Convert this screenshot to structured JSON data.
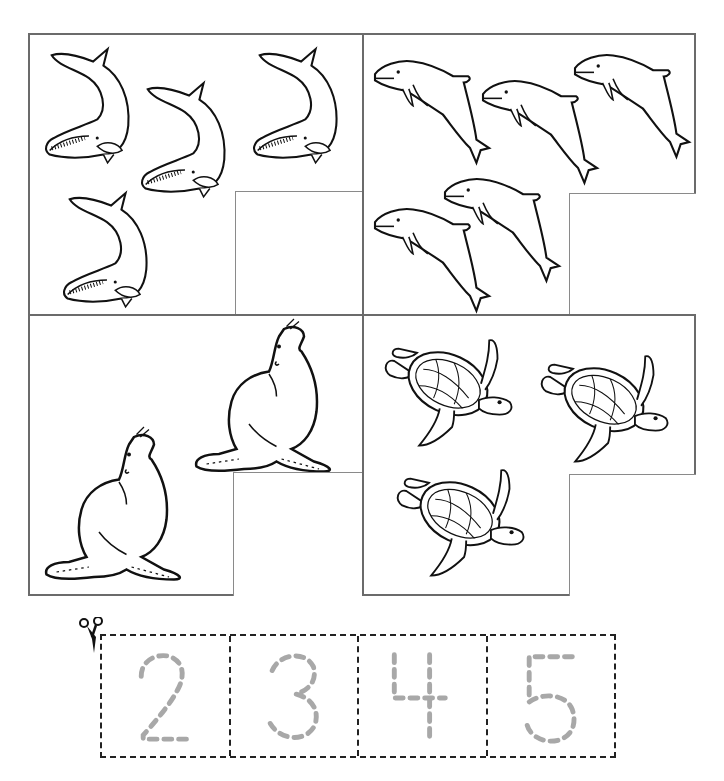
{
  "worksheet": {
    "type": "counting-match",
    "panels": [
      {
        "id": "whales",
        "animal": "whale",
        "count": 4,
        "answer_box": "empty"
      },
      {
        "id": "dolphins",
        "animal": "dolphin",
        "count": 5,
        "answer_box": "empty"
      },
      {
        "id": "sea-lions",
        "animal": "sea-lion",
        "count": 2,
        "answer_box": "empty"
      },
      {
        "id": "sea-turtles",
        "animal": "sea-turtle",
        "count": 3,
        "answer_box": "empty"
      }
    ],
    "cutout_strip": {
      "icon": "scissors-icon",
      "cards": [
        {
          "digit": "2",
          "style": "dashed-trace"
        },
        {
          "digit": "3",
          "style": "dashed-trace"
        },
        {
          "digit": "4",
          "style": "dashed-trace"
        },
        {
          "digit": "5",
          "style": "dashed-trace"
        }
      ]
    },
    "colors": {
      "frame": "#6b6b6b",
      "answer_box": "#8a8a8a",
      "trace_digits": "#a8a8a8",
      "cut_line": "#222222",
      "line_art": "#111111"
    }
  }
}
